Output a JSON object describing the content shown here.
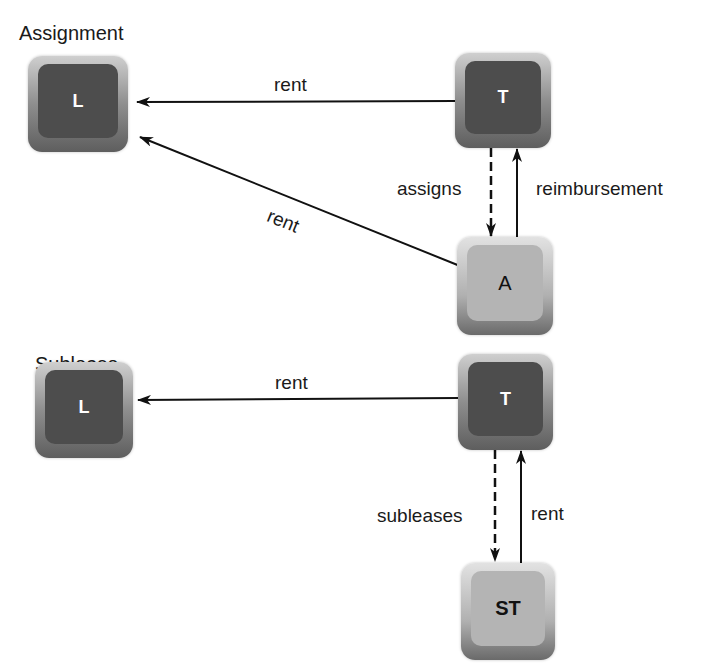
{
  "assignment": {
    "title": "Assignment",
    "nodes": {
      "landlord": "L",
      "tenant": "T",
      "assignee": "A"
    },
    "edges": {
      "tenant_to_landlord": "rent",
      "assignee_to_landlord": "rent",
      "tenant_to_assignee": "assigns",
      "assignee_to_tenant": "reimbursement"
    }
  },
  "sublease": {
    "title": "Sublease",
    "nodes": {
      "landlord": "L",
      "tenant": "T",
      "subtenant": "ST"
    },
    "edges": {
      "tenant_to_landlord": "rent",
      "tenant_to_subtenant": "subleases",
      "subtenant_to_tenant": "rent"
    }
  },
  "colors": {
    "dark_box": "#4d4d4d",
    "light_box": "#b4b4b4",
    "line": "#111111"
  }
}
